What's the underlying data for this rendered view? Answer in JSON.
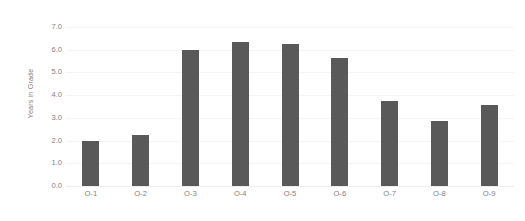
{
  "chart_data": {
    "type": "bar",
    "title": "",
    "subtitle": "",
    "xlabel": "",
    "ylabel": "Years in Grade",
    "categories": [
      "O-1",
      "O-2",
      "O-3",
      "O-4",
      "O-5",
      "O-6",
      "O-7",
      "O-8",
      "O-9"
    ],
    "values": [
      2.0,
      2.25,
      6.0,
      6.35,
      6.25,
      5.65,
      3.75,
      2.85,
      3.55
    ],
    "ylim": [
      0.0,
      7.0
    ],
    "ytick_step": 1.0,
    "ytick_labels": [
      "7.0",
      "6.0",
      "5.0",
      "4.0",
      "3.0",
      "2.0",
      "1.0",
      "0.0"
    ],
    "ytick_values": [
      7.0,
      6.0,
      5.0,
      4.0,
      3.0,
      2.0,
      1.0,
      0.0
    ],
    "grid": true,
    "grid_axis": "y",
    "legend": false,
    "legend_position": "none",
    "series": [
      {
        "name": "Years in Grade",
        "values": [
          2.0,
          2.25,
          6.0,
          6.35,
          6.25,
          5.65,
          3.75,
          2.85,
          3.55
        ]
      }
    ]
  },
  "colors": {
    "bar": "#595959",
    "gridline": "#f4f4f4",
    "baseline": "#ededed",
    "tick_text": "#7f7f7f",
    "axis_title_text": "#7f7f7f",
    "background": "#ffffff"
  }
}
